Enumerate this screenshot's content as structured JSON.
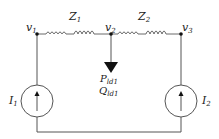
{
  "diagram": {
    "type": "circuit",
    "nodes": [
      {
        "id": "v1",
        "label": "v",
        "sub": "1"
      },
      {
        "id": "v2",
        "label": "v",
        "sub": "2"
      },
      {
        "id": "v3",
        "label": "v",
        "sub": "3"
      }
    ],
    "impedances": [
      {
        "id": "Z1",
        "label": "Z",
        "sub": "1",
        "from": "v1",
        "to": "v2"
      },
      {
        "id": "Z2",
        "label": "Z",
        "sub": "2",
        "from": "v2",
        "to": "v3"
      }
    ],
    "sources": [
      {
        "id": "I1",
        "label": "I",
        "sub": "1",
        "node": "v1",
        "direction": "up"
      },
      {
        "id": "I2",
        "label": "I",
        "sub": "2",
        "node": "v3",
        "direction": "up"
      }
    ],
    "load": {
      "node": "v2",
      "p_label": "P",
      "p_sub": "ld1",
      "q_label": "Q",
      "q_sub": "ld1"
    },
    "colors": {
      "wire": "#555555",
      "text": "#222222",
      "arrow": "#111111"
    }
  }
}
